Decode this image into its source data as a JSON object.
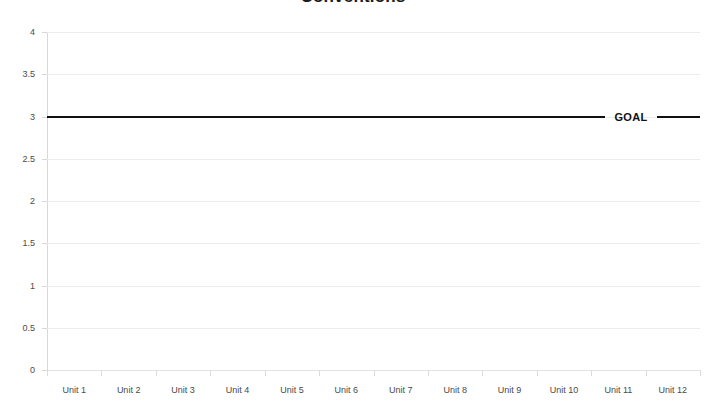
{
  "chart_data": {
    "type": "line",
    "title": "Conventions",
    "xlabel": "",
    "ylabel": "",
    "ylim": [
      0,
      4
    ],
    "grid": true,
    "legend_position": "inline-right",
    "categories": [
      "Unit 1",
      "Unit 2",
      "Unit 3",
      "Unit 4",
      "Unit 5",
      "Unit 6",
      "Unit 7",
      "Unit 8",
      "Unit 9",
      "Unit 10",
      "Unit 11",
      "Unit 12"
    ],
    "y_ticks": [
      "0",
      "0.5",
      "1",
      "1.5",
      "2",
      "2.5",
      "3",
      "3.5",
      "4"
    ],
    "y_tick_values": [
      0,
      0.5,
      1,
      1.5,
      2,
      2.5,
      3,
      3.5,
      4
    ],
    "series": [
      {
        "name": "GOAL",
        "type": "reference-line",
        "value": 3,
        "values": [
          3,
          3,
          3,
          3,
          3,
          3,
          3,
          3,
          3,
          3,
          3,
          3
        ],
        "color": "#111111",
        "label": "GOAL",
        "label_position": "right-inline"
      }
    ],
    "annotations": [
      {
        "text": "GOAL",
        "y": 3,
        "x": "Unit 11"
      }
    ]
  },
  "colors": {
    "goal_line": "#111111",
    "gridline": "#ececec",
    "axis": "#e2e2e2",
    "tick_label": "#4a4a4a",
    "title": "#1a1a1a",
    "background": "#ffffff"
  }
}
